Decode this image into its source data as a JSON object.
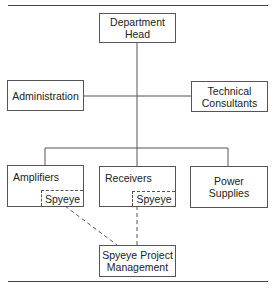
{
  "diagram": {
    "type": "org-chart",
    "nodes": {
      "head": "Department\nHead",
      "administration": "Administration",
      "technical": "Technical\nConsultants",
      "amplifiers": "Amplifiers",
      "receivers": "Receivers",
      "power": "Power\nSupplies",
      "spyeye_amplifiers": "Spyeye",
      "spyeye_receivers": "Spyeye",
      "spyeye_pm": "Spyeye Project\nManagement"
    },
    "edges": [
      {
        "from": "head",
        "to": "administration",
        "style": "solid"
      },
      {
        "from": "head",
        "to": "technical",
        "style": "solid"
      },
      {
        "from": "head",
        "to": "amplifiers",
        "style": "solid"
      },
      {
        "from": "head",
        "to": "receivers",
        "style": "solid"
      },
      {
        "from": "head",
        "to": "power",
        "style": "solid"
      },
      {
        "from": "spyeye_amplifiers",
        "to": "spyeye_pm",
        "style": "dashed"
      },
      {
        "from": "spyeye_receivers",
        "to": "spyeye_pm",
        "style": "dashed"
      }
    ],
    "colors": {
      "line": "#555555",
      "background": "#ffffff",
      "text": "#222222"
    }
  }
}
